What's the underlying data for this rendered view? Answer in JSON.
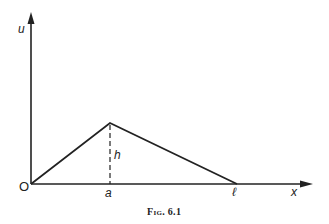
{
  "diagram": {
    "caption": "Fig. 6.1",
    "axes": {
      "x_label": "x",
      "y_label": "u",
      "origin_label": "O"
    },
    "points": {
      "origin": {
        "label": "O",
        "x": 31,
        "y": 184
      },
      "peak": {
        "label": "",
        "x": 110,
        "y": 123
      },
      "foot": {
        "label": "a",
        "x": 110,
        "y": 184
      },
      "end": {
        "label": "ℓ",
        "x": 237,
        "y": 184
      }
    },
    "height_label": "h",
    "peak_x_label": "a",
    "end_label": "ℓ",
    "colors": {
      "line": "#222222",
      "background": "#ffffff"
    }
  }
}
